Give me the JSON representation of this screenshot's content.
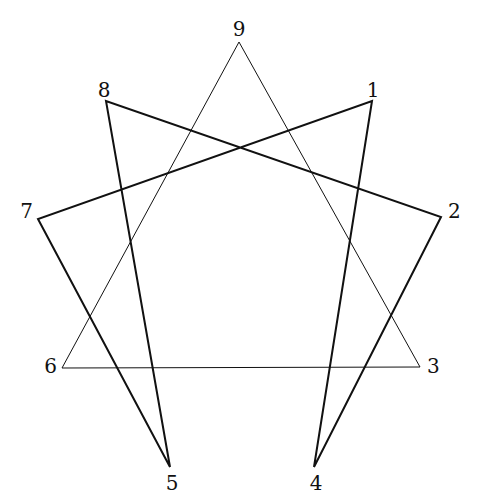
{
  "diagram": {
    "type": "enneagram",
    "points": [
      {
        "id": "9",
        "label": "9",
        "x": 239,
        "y": 42,
        "lx": 239,
        "ly": 36,
        "anchor": "middle"
      },
      {
        "id": "1",
        "label": "1",
        "x": 372,
        "y": 101,
        "lx": 373,
        "ly": 97,
        "anchor": "middle"
      },
      {
        "id": "2",
        "label": "2",
        "x": 441,
        "y": 217,
        "lx": 448,
        "ly": 218,
        "anchor": "start"
      },
      {
        "id": "3",
        "label": "3",
        "x": 420,
        "y": 367,
        "lx": 427,
        "ly": 373,
        "anchor": "start"
      },
      {
        "id": "4",
        "label": "4",
        "x": 314,
        "y": 467,
        "lx": 316,
        "ly": 490,
        "anchor": "middle"
      },
      {
        "id": "5",
        "label": "5",
        "x": 170,
        "y": 467,
        "lx": 172,
        "ly": 490,
        "anchor": "middle"
      },
      {
        "id": "6",
        "label": "6",
        "x": 62,
        "y": 368,
        "lx": 57,
        "ly": 373,
        "anchor": "end"
      },
      {
        "id": "7",
        "label": "7",
        "x": 38,
        "y": 219,
        "lx": 33,
        "ly": 218,
        "anchor": "end"
      },
      {
        "id": "8",
        "label": "8",
        "x": 106,
        "y": 101,
        "lx": 104,
        "ly": 97,
        "anchor": "middle"
      }
    ],
    "triangle": [
      "9",
      "3",
      "6"
    ],
    "hexad": [
      "1",
      "4",
      "2",
      "8",
      "5",
      "7"
    ],
    "line_color": "#111111",
    "triangle_stroke": 1,
    "hexad_stroke": 2
  }
}
